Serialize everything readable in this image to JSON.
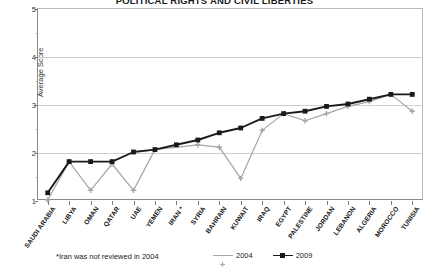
{
  "chart_data": {
    "type": "line",
    "title": "POLITICAL RIGHTS AND CIVIL LIBERTIES",
    "xlabel": "",
    "ylabel": "Average Score",
    "ylim": [
      1,
      5
    ],
    "yticks": [
      1,
      2,
      3,
      4,
      5
    ],
    "yticks_minor": [
      1.5,
      2.5,
      3.5,
      4.5
    ],
    "grid": true,
    "legend_position": "bottom-right",
    "footnote": "*Iran was not reviewed in 2004",
    "categories": [
      "SAUDI ARABIA",
      "LIBYA",
      "OMAN",
      "QATAR",
      "UAE",
      "YEMEN",
      "IRAN *",
      "SYRIA",
      "BAHRAIN",
      "KUWAIT",
      "IRAQ",
      "EGYPT",
      "PALESTINE",
      "JORDAN",
      "LEBANON",
      "ALGERIA",
      "MOROCCO",
      "TUNISIA"
    ],
    "series": [
      {
        "name": "2004",
        "color": "#a6a6a6",
        "marker": "plus",
        "values": [
          1.0,
          1.8,
          1.2,
          1.75,
          1.2,
          2.05,
          null,
          2.15,
          2.1,
          1.45,
          2.45,
          2.8,
          2.65,
          2.8,
          2.95,
          3.05,
          3.2,
          2.85
        ]
      },
      {
        "name": "2009",
        "color": "#1a1a1a",
        "marker": "square",
        "values": [
          1.15,
          1.8,
          1.8,
          1.8,
          2.0,
          2.05,
          2.15,
          2.25,
          2.4,
          2.5,
          2.7,
          2.8,
          2.85,
          2.95,
          3.0,
          3.1,
          3.2,
          3.2
        ]
      }
    ]
  },
  "legend": {
    "items": [
      {
        "label": "2004"
      },
      {
        "label": "2009"
      }
    ]
  },
  "colors": {
    "series_2004": "#a6a6a6",
    "series_2009": "#1a1a1a",
    "grid": "#cfcfcf",
    "axis": "#8a8a8a"
  }
}
